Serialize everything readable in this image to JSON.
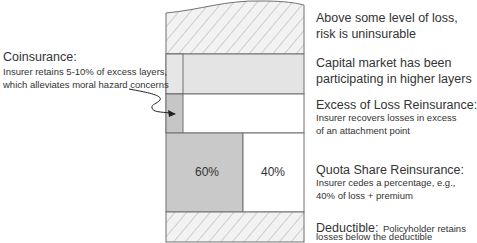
{
  "diagram": {
    "colors": {
      "border": "#707070",
      "hatch": "#a8a8a8",
      "capital_fill": "#e4e4e4",
      "coinsurance_fill": "#c6c6c6",
      "retained_fill": "#c9c9c9",
      "ceded_fill": "#ffffff"
    },
    "layers": {
      "uninsurable": {
        "title": "Above some level of loss,",
        "title2": "risk is uninsurable"
      },
      "capital_market": {
        "title": "Capital market has been",
        "title2": "participating in higher layers"
      },
      "excess_of_loss": {
        "title": "Excess of Loss Reinsurance:",
        "sub1": "Insurer recovers losses in excess",
        "sub2": "of an attachment point"
      },
      "quota_share": {
        "title": "Quota Share Reinsurance:",
        "sub1": "Insurer cedes a percentage, e.g.,",
        "sub2": "40% of loss + premium",
        "retained_pct": "60%",
        "ceded_pct": "40%"
      },
      "deductible": {
        "title": "Deductible:",
        "sub_inline": "Policyholder retains",
        "sub2": "losses below the deductible"
      }
    },
    "coinsurance": {
      "title": "Coinsurance:",
      "sub1": "Insurer retains 5-10% of excess layers,",
      "sub2": "which alleviates moral hazard concerns"
    }
  }
}
